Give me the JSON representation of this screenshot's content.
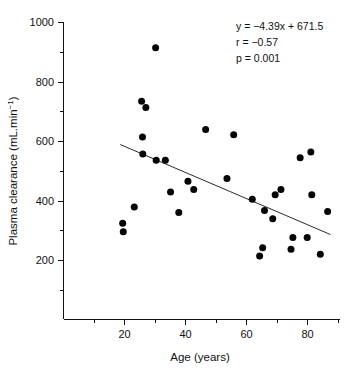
{
  "chart_data": {
    "type": "scatter",
    "title": "",
    "xlabel": "Age (years)",
    "ylabel": "Plasma clearance (mL.min⁻¹)",
    "ylabel_base": "Plasma clearance (mL.min",
    "ylabel_sup": "−1",
    "ylabel_tail": ")",
    "xlim": [
      0,
      90.3
    ],
    "ylim": [
      0,
      1000
    ],
    "grid": false,
    "legend": "none",
    "xticks": [
      20,
      40,
      60,
      80
    ],
    "xtick_labels": [
      "20",
      "40",
      "60",
      "80"
    ],
    "xticks_minor": [
      10,
      30,
      50,
      70,
      90
    ],
    "yticks": [
      200,
      400,
      600,
      800,
      1000
    ],
    "ytick_labels": [
      "200",
      "400",
      "600",
      "800",
      "1000"
    ],
    "yticks_minor": [
      100,
      300,
      500,
      700,
      900
    ],
    "point_color": "#050505",
    "line_color": "#2b2b2b",
    "axis_color": "#111111",
    "x": [
      19.4,
      19.6,
      23.2,
      25.6,
      25.9,
      26.0,
      27.0,
      30.2,
      30.4,
      33.4,
      35.1,
      37.8,
      40.8,
      42.7,
      46.6,
      53.6,
      55.8,
      61.9,
      64.3,
      65.3,
      65.9,
      68.6,
      69.4,
      71.3,
      74.6,
      75.2,
      77.6,
      79.9,
      81.1,
      81.4,
      84.2,
      86.6
    ],
    "y": [
      325,
      297,
      380,
      735,
      615,
      558,
      714,
      915,
      537,
      537,
      430,
      361,
      466,
      439,
      640,
      476,
      623,
      406,
      215,
      243,
      368,
      340,
      421,
      439,
      238,
      277,
      545,
      277,
      565,
      421,
      221,
      365
    ],
    "points": [
      {
        "x": 19.4,
        "y": 325
      },
      {
        "x": 19.6,
        "y": 297
      },
      {
        "x": 23.2,
        "y": 380
      },
      {
        "x": 25.6,
        "y": 735
      },
      {
        "x": 25.9,
        "y": 615
      },
      {
        "x": 26.0,
        "y": 558
      },
      {
        "x": 27.0,
        "y": 714
      },
      {
        "x": 30.2,
        "y": 915
      },
      {
        "x": 30.4,
        "y": 537
      },
      {
        "x": 33.4,
        "y": 537
      },
      {
        "x": 35.1,
        "y": 430
      },
      {
        "x": 37.8,
        "y": 361
      },
      {
        "x": 40.8,
        "y": 466
      },
      {
        "x": 42.7,
        "y": 439
      },
      {
        "x": 46.6,
        "y": 640
      },
      {
        "x": 53.6,
        "y": 476
      },
      {
        "x": 55.8,
        "y": 623
      },
      {
        "x": 61.9,
        "y": 406
      },
      {
        "x": 64.3,
        "y": 215
      },
      {
        "x": 65.3,
        "y": 243
      },
      {
        "x": 65.9,
        "y": 368
      },
      {
        "x": 68.6,
        "y": 340
      },
      {
        "x": 69.4,
        "y": 421
      },
      {
        "x": 71.3,
        "y": 439
      },
      {
        "x": 74.6,
        "y": 238
      },
      {
        "x": 75.2,
        "y": 277
      },
      {
        "x": 77.6,
        "y": 545
      },
      {
        "x": 79.9,
        "y": 277
      },
      {
        "x": 81.1,
        "y": 565
      },
      {
        "x": 81.4,
        "y": 421
      },
      {
        "x": 84.2,
        "y": 221
      },
      {
        "x": 86.6,
        "y": 365
      }
    ],
    "fit_line": {
      "slope": -4.39,
      "intercept": 671.5,
      "x_start": 18.6,
      "x_end": 87.5,
      "y_start": 589.8,
      "y_end": 287.4
    },
    "annotations": {
      "equation": "y = −4.39x + 671.5",
      "correlation": "r = −0.57",
      "pvalue": "p = 0.001"
    }
  }
}
